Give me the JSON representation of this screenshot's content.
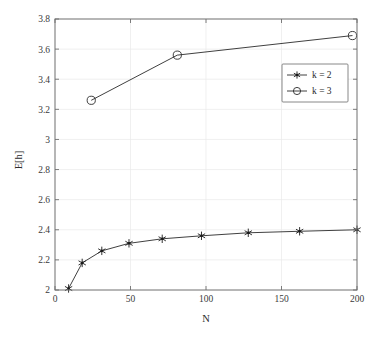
{
  "chart_data": {
    "type": "line",
    "title": "",
    "xlabel": "N",
    "ylabel": "E[h]",
    "xlim": [
      0,
      200
    ],
    "ylim": [
      2,
      3.8
    ],
    "grid": true,
    "legend_position": "center-right",
    "xticks": [
      "0",
      "50",
      "100",
      "150",
      "200"
    ],
    "xtick_values": [
      0,
      50,
      100,
      150,
      200
    ],
    "yticks": [
      "2",
      "2.2",
      "2.4",
      "2.6",
      "2.8",
      "3",
      "3.2",
      "3.4",
      "3.6",
      "3.8"
    ],
    "ytick_values": [
      2,
      2.2,
      2.4,
      2.6,
      2.8,
      3,
      3.2,
      3.4,
      3.6,
      3.8
    ],
    "series": [
      {
        "name": "k = 2",
        "marker": "star",
        "color": "#1a1a1a",
        "x": [
          9,
          18,
          31,
          49,
          71,
          97,
          128,
          162,
          200
        ],
        "values": [
          2.01,
          2.18,
          2.26,
          2.31,
          2.34,
          2.36,
          2.38,
          2.39,
          2.4
        ]
      },
      {
        "name": "k = 3",
        "marker": "circle",
        "color": "#1a1a1a",
        "x": [
          24,
          81,
          197
        ],
        "values": [
          3.26,
          3.56,
          3.69
        ]
      }
    ]
  },
  "legend": {
    "entries": [
      {
        "label": "k = 2",
        "marker": "star"
      },
      {
        "label": "k = 3",
        "marker": "circle"
      }
    ]
  },
  "axes": {
    "x_title": "N",
    "y_title": "E[h]"
  }
}
